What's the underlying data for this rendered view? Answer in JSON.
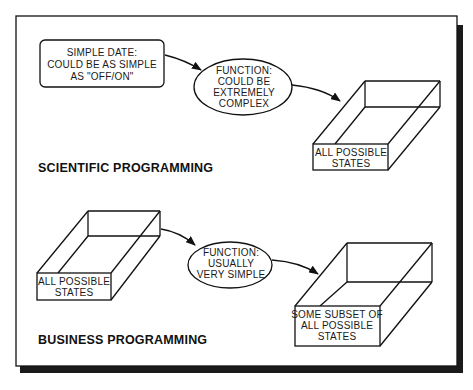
{
  "sections": {
    "scientific": {
      "title": "SCIENTIFIC PROGRAMMING",
      "input_box": {
        "lines": [
          "SIMPLE DATE:",
          "COULD BE AS SIMPLE",
          "AS \"OFF/ON\""
        ]
      },
      "function": {
        "lines": [
          "FUNCTION:",
          "COULD BE",
          "EXTREMELY",
          "COMPLEX"
        ]
      },
      "output_box": {
        "lines": [
          "ALL POSSIBLE",
          "STATES"
        ]
      }
    },
    "business": {
      "title": "BUSINESS PROGRAMMING",
      "input_box": {
        "lines": [
          "ALL POSSIBLE",
          "STATES"
        ]
      },
      "function": {
        "lines": [
          "FUNCTION:",
          "USUALLY",
          "VERY SIMPLE"
        ]
      },
      "output_box": {
        "lines": [
          "SOME SUBSET OF",
          "ALL POSSIBLE",
          "STATES"
        ]
      }
    }
  },
  "colors": {
    "ink": "#111111",
    "paper": "#ffffff",
    "shadow": "#1a1a1a"
  }
}
